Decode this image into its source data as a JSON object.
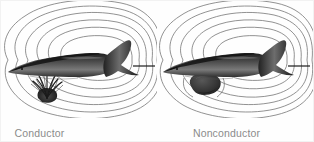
{
  "figure": {
    "background_color": "#fefefe",
    "width": 314,
    "height": 142
  },
  "panels": [
    {
      "id": "left",
      "caption": "Conductor",
      "caption_color": "#8b8b8b",
      "object": {
        "name": "conducting-plant-object",
        "description": "dark spiky plant-like conducting object below the fish",
        "color": "#2b2b2b",
        "field_effect": "field lines converge toward and bend into the object"
      },
      "fish": {
        "name": "electric-fish",
        "orientation": "head-left-tail-right",
        "body_color": "#3a3a3a"
      },
      "field": {
        "line_color": "#6e6e6e",
        "line_count": 6,
        "pattern": "concentric-dipole-loops"
      }
    },
    {
      "id": "right",
      "caption": "Nonconductor",
      "caption_color": "#8b8b8b",
      "object": {
        "name": "nonconducting-rock-object",
        "description": "dark irregular rock-like nonconducting blob below the fish",
        "color": "#3d3d3d",
        "field_effect": "field lines diverge and bend away around the object"
      },
      "fish": {
        "name": "electric-fish",
        "orientation": "head-left-tail-right",
        "body_color": "#3a3a3a"
      },
      "field": {
        "line_color": "#6e6e6e",
        "line_count": 6,
        "pattern": "concentric-dipole-loops"
      }
    }
  ]
}
